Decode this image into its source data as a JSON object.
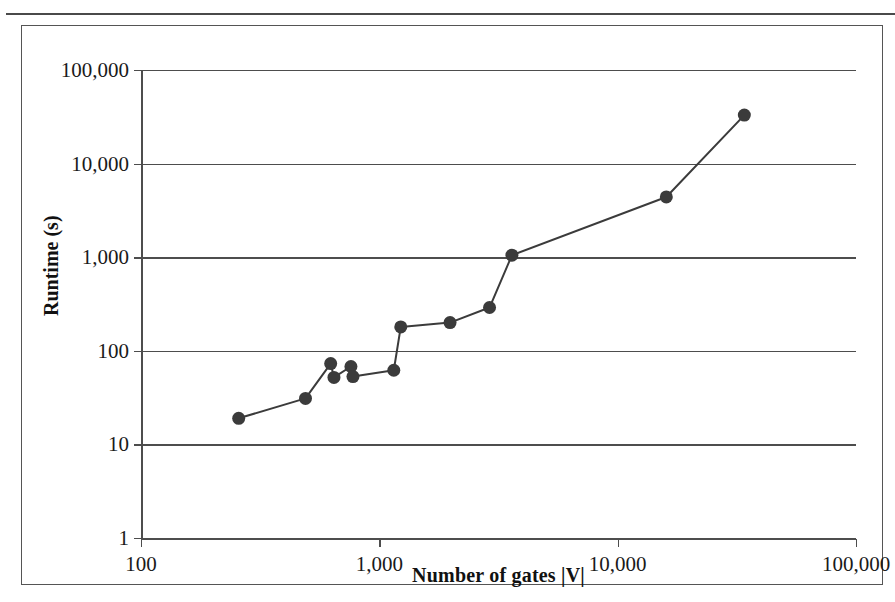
{
  "chart_data": {
    "type": "line",
    "title": "",
    "xlabel": "Number of gates |V|",
    "ylabel": "Runtime (s)",
    "x_scale": "log",
    "y_scale": "log",
    "xlim": [
      100,
      100000
    ],
    "ylim": [
      1,
      100000
    ],
    "grid": true,
    "legend": false,
    "x_ticks": [
      "100",
      "1,000",
      "10,000",
      "100,000"
    ],
    "x_tick_values": [
      100,
      1000,
      10000,
      100000
    ],
    "y_ticks": [
      "1",
      "10",
      "100",
      "1,000",
      "10,000",
      "100,000"
    ],
    "y_tick_values": [
      1,
      10,
      100,
      1000,
      10000,
      100000
    ],
    "marker": "filled-circle",
    "marker_color": "#3b3b3b",
    "line_color": "#3b3b3b",
    "series": [
      {
        "name": "Runtime",
        "points": [
          {
            "x": 257,
            "y": 19
          },
          {
            "x": 490,
            "y": 31
          },
          {
            "x": 625,
            "y": 73
          },
          {
            "x": 645,
            "y": 52
          },
          {
            "x": 760,
            "y": 68
          },
          {
            "x": 775,
            "y": 53
          },
          {
            "x": 1150,
            "y": 62
          },
          {
            "x": 1230,
            "y": 180
          },
          {
            "x": 1980,
            "y": 200
          },
          {
            "x": 2900,
            "y": 290
          },
          {
            "x": 3600,
            "y": 1050
          },
          {
            "x": 16000,
            "y": 4400
          },
          {
            "x": 34000,
            "y": 33000
          }
        ]
      }
    ]
  },
  "axis": {
    "y_title": "Runtime (s)",
    "x_title": "Number of gates |V|"
  }
}
